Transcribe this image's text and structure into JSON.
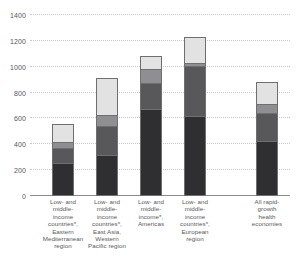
{
  "chart_data": {
    "type": "bar",
    "stacked": true,
    "title": "",
    "subtitle": "",
    "xlabel": "",
    "ylabel": "",
    "ylim": [
      0,
      1400
    ],
    "ytick_values": [
      0,
      200,
      400,
      600,
      800,
      1000,
      1200,
      1400
    ],
    "ytick_labels": [
      "0",
      "200",
      "400",
      "600",
      "800",
      "1000",
      "1200",
      "1400"
    ],
    "grid": true,
    "legend_position": "none",
    "categories": [
      "Low- and middle-income countries*, Eastern Mediterranean region",
      "Low- and middle-income countries*, East Asia, Western Pacific region",
      "Low- and middle-income*, Americas",
      "Low- and middle-income countries*, European region",
      "All rapid-growth health economies"
    ],
    "series": [
      {
        "name": "segment-1-darkest",
        "color": "#2f2f31",
        "values": [
          250,
          305,
          670,
          615,
          420
        ]
      },
      {
        "name": "segment-2-dark-gray",
        "color": "#58585a",
        "values": [
          120,
          230,
          205,
          385,
          220
        ]
      },
      {
        "name": "segment-3-mid-gray",
        "color": "#8f8f92",
        "values": [
          45,
          90,
          110,
          30,
          65
        ]
      },
      {
        "name": "segment-4-light-gray",
        "color": "#e2e2e2",
        "values": [
          145,
          285,
          95,
          200,
          175
        ]
      }
    ],
    "totals": [
      560,
      910,
      1080,
      1230,
      880
    ]
  },
  "xlabels": [
    "Low- and\nmiddle-\nincome\ncountries*,\nEastern\nMediterranean\nregion",
    "Low- and\nmiddle-\nincome\ncountries*,\nEast Asia,\nWestern\nPacific region",
    "Low- and\nmiddle-\nincome*,\nAmericas",
    "Low- and\nmiddle-\nincome\ncountries*,\nEuropean\nregion",
    "All rapid-\ngrowth\nhealth\neconomies"
  ],
  "colors": {
    "axis": "#8d8d90",
    "grid": "#c9c9cb",
    "text": "#58585a",
    "background": "#ffffff",
    "bar_outline": "#6f6f72"
  }
}
